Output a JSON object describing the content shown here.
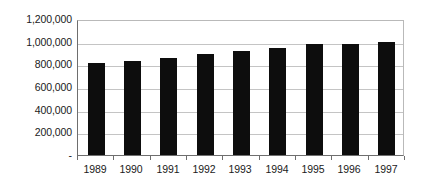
{
  "chart_data": {
    "type": "bar",
    "title": "",
    "subtitle": "",
    "xlabel": "",
    "ylabel": "",
    "categories": [
      "1989",
      "1990",
      "1991",
      "1992",
      "1993",
      "1994",
      "1995",
      "1996",
      "1997"
    ],
    "values": [
      810000,
      825000,
      855000,
      895000,
      920000,
      945000,
      975000,
      975000,
      1000000
    ],
    "series": [
      {
        "name": "",
        "values": [
          810000,
          825000,
          855000,
          895000,
          920000,
          945000,
          975000,
          975000,
          1000000
        ],
        "color": "#0d0d0d"
      }
    ],
    "ylim": [
      0,
      1200000
    ],
    "y_ticks": [
      0,
      200000,
      400000,
      600000,
      800000,
      1000000,
      1200000
    ],
    "y_tick_labels": [
      "-",
      "200,000",
      "400,000",
      "600,000",
      "800,000",
      "1,000,000",
      "1,200,000"
    ],
    "x_tick_labels": [
      "1989",
      "1990",
      "1991",
      "1992",
      "1993",
      "1994",
      "1995",
      "1996",
      "1997"
    ],
    "grid": true,
    "grid_axis": "y",
    "legend": false,
    "legend_position": "none",
    "annotations": [],
    "colors": {
      "bar": "#0d0d0d",
      "gridline": "#c4c4c4",
      "axis": "#6e6e6e",
      "plot_border": "#b9b9b9",
      "background": "#ffffff",
      "text": "#1a1a1a"
    }
  }
}
